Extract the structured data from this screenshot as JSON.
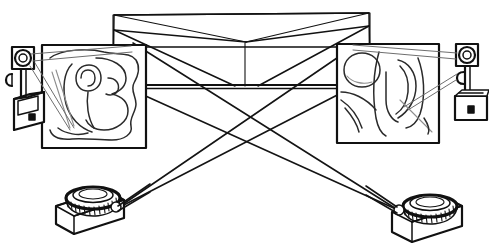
{
  "figure": {
    "title": "Two-projector cross-projection setup sketch",
    "style": "hand-drawn line sketch, black ink on white",
    "background_color": "#ffffff",
    "ink_color": "#111111",
    "faint_ink_color": "#8d8d8d",
    "width": 489,
    "height": 251
  },
  "scene": {
    "center_structure": {
      "name": "folded-backdrop",
      "description": "large open box / folded screen backdrop with V-shaped crease meeting at centre",
      "top_left": [
        114,
        14
      ],
      "top_right": [
        369,
        13
      ],
      "apex": [
        246,
        42
      ],
      "band_top_y": 84,
      "band_bottom_y": 88,
      "left_wall_x": 131,
      "right_wall_x": 353,
      "crease_vertical_x": 245
    },
    "panels": [
      {
        "name": "left-artwork-panel",
        "label": "left projected image",
        "x": 42,
        "y": 45,
        "width": 104,
        "height": 103,
        "content": "abstract looping scribble, large rounded loops forming a figure-like motif"
      },
      {
        "name": "right-artwork-panel",
        "label": "right projected image",
        "x": 337,
        "y": 44,
        "width": 102,
        "height": 99,
        "content": "abstract sketch with a circle at upper-left and tall curved flame-like strokes"
      }
    ],
    "cameras": [
      {
        "name": "left-camera-on-stand",
        "label": "left camera",
        "position": [
          22,
          86
        ],
        "facing": "right",
        "parts": [
          "lens-head",
          "post",
          "side-knob",
          "body-box",
          "viewfinder-window",
          "front-button"
        ]
      },
      {
        "name": "right-camera-on-stand",
        "label": "right camera",
        "position": [
          466,
          80
        ],
        "facing": "left",
        "parts": [
          "lens-head",
          "post",
          "side-knob",
          "body-box",
          "front-button"
        ]
      }
    ],
    "projectors": [
      {
        "name": "left-projector",
        "label": "left projector",
        "base": [
          56,
          212
        ],
        "lens_center": [
          93,
          199
        ],
        "lens_rim": "ribbed ring barrel",
        "beam_origin": [
          116,
          209
        ]
      },
      {
        "name": "right-projector",
        "label": "right projector",
        "base": [
          392,
          219
        ],
        "lens_center": [
          430,
          208
        ],
        "lens_rim": "ribbed ring barrel",
        "beam_origin": [
          398,
          210
        ]
      }
    ],
    "rays": [
      {
        "name": "ray-left-projector-to-right-panel-top",
        "from": [
          116,
          209
        ],
        "to": [
          353,
          46
        ]
      },
      {
        "name": "ray-left-projector-to-right-panel-bottom",
        "from": [
          116,
          209
        ],
        "to": [
          345,
          90
        ]
      },
      {
        "name": "ray-right-projector-to-left-panel-top",
        "from": [
          398,
          210
        ],
        "to": [
          136,
          44
        ]
      },
      {
        "name": "ray-right-projector-to-left-panel-bottom",
        "from": [
          398,
          210
        ],
        "to": [
          140,
          92
        ]
      },
      {
        "name": "ray-left-camera-to-left-panel",
        "from": [
          28,
          58
        ],
        "to": [
          131,
          46
        ]
      },
      {
        "name": "ray-left-camera-to-left-panel-low",
        "from": [
          30,
          97
        ],
        "to": [
          128,
          56
        ]
      },
      {
        "name": "ray-right-camera-to-right-panel",
        "from": [
          462,
          56
        ],
        "to": [
          352,
          46
        ]
      },
      {
        "name": "ray-right-camera-to-right-panel-low",
        "from": [
          459,
          74
        ],
        "to": [
          352,
          55
        ]
      }
    ],
    "crossing_point": {
      "name": "beam-crossing",
      "approx": [
        246,
        132
      ]
    }
  }
}
